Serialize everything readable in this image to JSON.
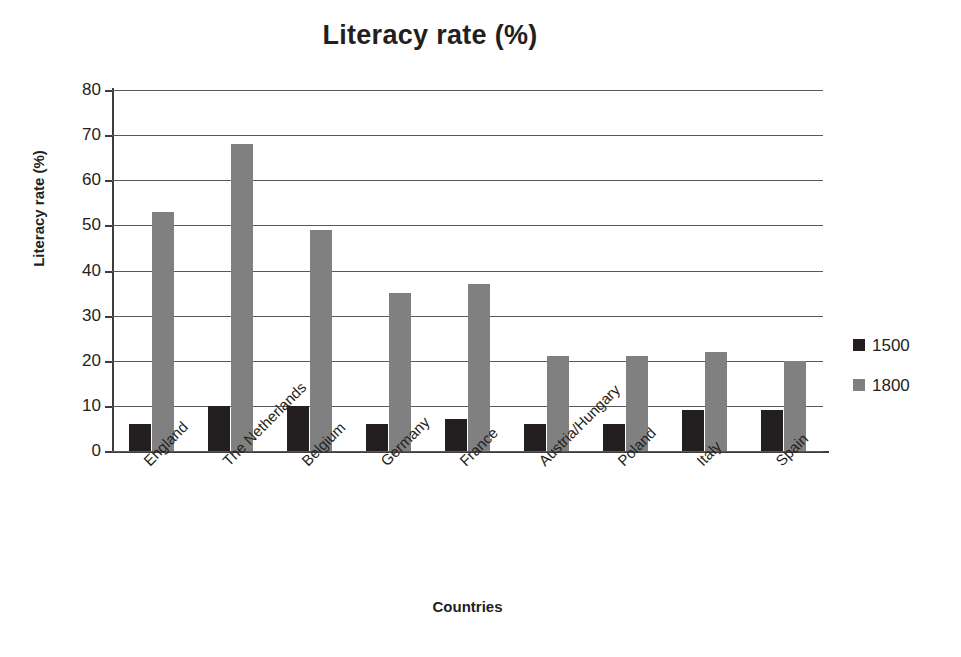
{
  "chart_data": {
    "type": "bar",
    "title": "Literacy rate (%)",
    "xlabel": "Countries",
    "ylabel": "Literacy rate (%)",
    "categories": [
      "England",
      "The Netherlands",
      "Belgium",
      "Germany",
      "France",
      "Austria/Hungary",
      "Poland",
      "Italy",
      "Spain"
    ],
    "series": [
      {
        "name": "1500",
        "color": "#231f20",
        "values": [
          6,
          10,
          10,
          6,
          7,
          6,
          6,
          9,
          9
        ]
      },
      {
        "name": "1800",
        "color": "#808080",
        "values": [
          53,
          68,
          49,
          35,
          37,
          21,
          21,
          22,
          20
        ]
      }
    ],
    "ylim": [
      0,
      80
    ],
    "yticks": [
      0,
      10,
      20,
      30,
      40,
      50,
      60,
      70,
      80
    ],
    "ytick_labels": [
      "0",
      "10",
      "20",
      "30",
      "40",
      "50",
      "60",
      "70",
      "80"
    ],
    "grid": true,
    "grid_axis": "y",
    "legend_position": "right",
    "legend_entries": [
      "1500",
      "1800"
    ],
    "x_tick_label_rotation": -45,
    "background_color": "#ffffff",
    "axis_color": "#3d3d3d",
    "text_color": "#231f20"
  }
}
